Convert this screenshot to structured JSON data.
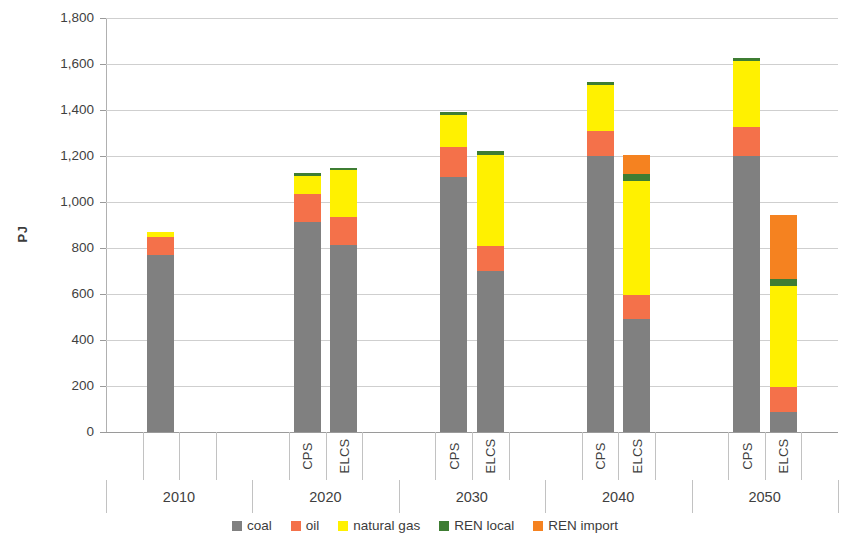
{
  "chart_data": {
    "type": "bar",
    "stacked": true,
    "title": "",
    "xlabel": "",
    "ylabel": "PJ",
    "ylim": [
      0,
      1800
    ],
    "ytick_step": 200,
    "ytick_labels": [
      "1,800",
      "1,600",
      "1,400",
      "1,200",
      "1,000",
      "800",
      "600",
      "400",
      "200",
      "0"
    ],
    "ytick_values": [
      1800,
      1600,
      1400,
      1200,
      1000,
      800,
      600,
      400,
      200,
      0
    ],
    "grid": true,
    "legend_position": "bottom",
    "groups": [
      {
        "year": "2010",
        "scenarios": [
          "",
          ""
        ]
      },
      {
        "year": "2020",
        "scenarios": [
          "CPS",
          "ELCS"
        ]
      },
      {
        "year": "2030",
        "scenarios": [
          "CPS",
          "ELCS"
        ]
      },
      {
        "year": "2040",
        "scenarios": [
          "CPS",
          "ELCS"
        ]
      },
      {
        "year": "2050",
        "scenarios": [
          "CPS",
          "ELCS"
        ]
      }
    ],
    "categories": [
      "2010",
      "2020 CPS",
      "2020 ELCS",
      "2030 CPS",
      "2030 ELCS",
      "2040 CPS",
      "2040 ELCS",
      "2050 CPS",
      "2050 ELCS"
    ],
    "series": [
      {
        "name": "coal",
        "color": "#808080",
        "values": [
          770,
          915,
          815,
          1110,
          700,
          1200,
          490,
          1200,
          85
        ]
      },
      {
        "name": "oil",
        "color": "#F4714A",
        "values": [
          80,
          120,
          120,
          130,
          110,
          110,
          105,
          125,
          110
        ]
      },
      {
        "name": "natural gas",
        "color": "#FFF100",
        "values": [
          20,
          80,
          205,
          140,
          395,
          200,
          495,
          290,
          440
        ]
      },
      {
        "name": "REN local",
        "color": "#3E7D33",
        "values": [
          0,
          10,
          10,
          10,
          15,
          10,
          30,
          10,
          30
        ]
      },
      {
        "name": "REN import",
        "color": "#F58220",
        "values": [
          0,
          0,
          0,
          0,
          0,
          0,
          85,
          0,
          280
        ]
      }
    ],
    "totals": [
      870,
      1125,
      1150,
      1390,
      1220,
      1520,
      1205,
      1625,
      945
    ]
  },
  "legend": {
    "items": [
      {
        "label": "coal",
        "color": "#808080",
        "icon": "square-swatch-icon"
      },
      {
        "label": "oil",
        "color": "#F4714A",
        "icon": "square-swatch-icon"
      },
      {
        "label": "natural gas",
        "color": "#FFF100",
        "icon": "square-swatch-icon"
      },
      {
        "label": "REN local",
        "color": "#3E7D33",
        "icon": "square-swatch-icon"
      },
      {
        "label": "REN import",
        "color": "#F58220",
        "icon": "square-swatch-icon"
      }
    ]
  }
}
